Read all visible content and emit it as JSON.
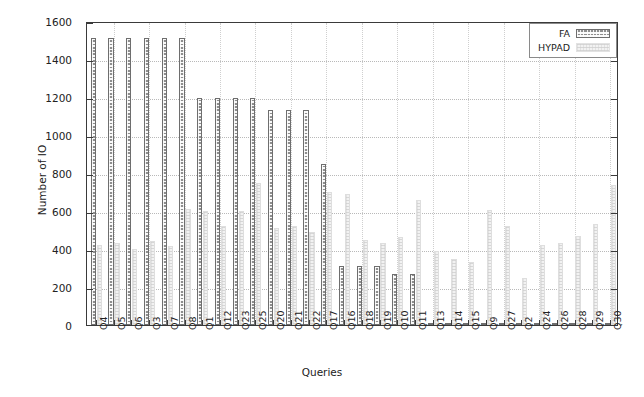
{
  "chart_data": {
    "type": "bar",
    "title": "",
    "xlabel": "Queries",
    "ylabel": "Number of IO",
    "ylim": [
      0,
      1600
    ],
    "yticks": [
      0,
      200,
      400,
      600,
      800,
      1000,
      1200,
      1400,
      1600
    ],
    "grid": true,
    "legend_position": "top-right",
    "categories": [
      "Q4",
      "Q5",
      "Q6",
      "Q3",
      "Q7",
      "Q8",
      "Q1",
      "Q12",
      "Q23",
      "Q25",
      "Q20",
      "Q21",
      "Q22",
      "Q17",
      "Q16",
      "Q18",
      "Q19",
      "Q10",
      "Q11",
      "Q13",
      "Q14",
      "Q15",
      "Q9",
      "Q27",
      "Q2",
      "Q24",
      "Q26",
      "Q28",
      "Q29",
      "Q30"
    ],
    "series": [
      {
        "name": "FA",
        "color": "#8e8e8e",
        "values": [
          1510,
          1510,
          1510,
          1510,
          1510,
          1510,
          1195,
          1195,
          1195,
          1195,
          1130,
          1130,
          1130,
          850,
          310,
          310,
          310,
          270,
          270,
          12,
          12,
          10,
          10,
          8,
          8,
          8,
          8,
          8,
          8,
          8
        ]
      },
      {
        "name": "HYPAD",
        "color": "#f2f2f2",
        "values": [
          420,
          430,
          400,
          440,
          415,
          610,
          600,
          520,
          600,
          745,
          510,
          520,
          490,
          700,
          690,
          450,
          430,
          465,
          660,
          390,
          345,
          330,
          605,
          520,
          245,
          420,
          430,
          470,
          530,
          735
        ]
      }
    ]
  },
  "legend": {
    "entries": [
      {
        "label": "FA",
        "swatch": "fa-pattern-swatch"
      },
      {
        "label": "HYPAD",
        "swatch": "hypad-pattern-swatch"
      }
    ]
  },
  "axes": {
    "y_title": "Number of IO",
    "x_title": "Queries"
  }
}
